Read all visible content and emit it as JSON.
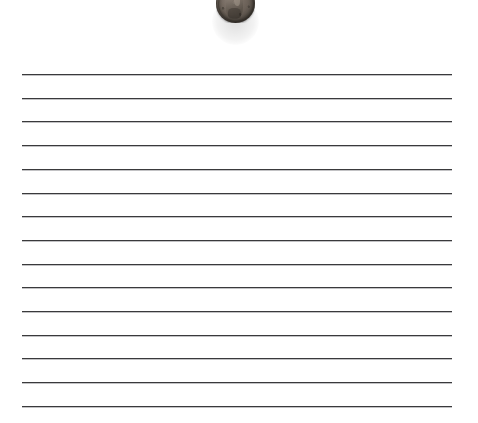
{
  "scene": {
    "title": "Lined paper with a coin",
    "width": 478,
    "height": 423,
    "background_color": "#ffffff"
  },
  "paper": {
    "name": "ruled-notebook-paper",
    "background_color": "#ffffff",
    "line_color": "#3a3a3c",
    "line_thickness_px": 1,
    "line_left_px": 22,
    "line_right_px": 452,
    "line_count": 15,
    "first_line_y_px": 74,
    "line_spacing_px": 23.7,
    "lines_y_px": [
      74,
      97.7,
      121.4,
      145.1,
      168.8,
      192.5,
      216.2,
      239.9,
      263.6,
      287.3,
      311,
      334.7,
      358.4,
      382.1,
      405.8
    ]
  },
  "coin": {
    "name": "us-penny",
    "label": "penny",
    "denomination_side": "obverse",
    "center_x_px": 235,
    "center_y_px": 3,
    "diameter_px": 39,
    "clipped_top": true,
    "visible_bottom_y_px": 24,
    "rim_color": "#403b36",
    "face_color": "#6a6057",
    "highlight_color": "#8d8279"
  }
}
